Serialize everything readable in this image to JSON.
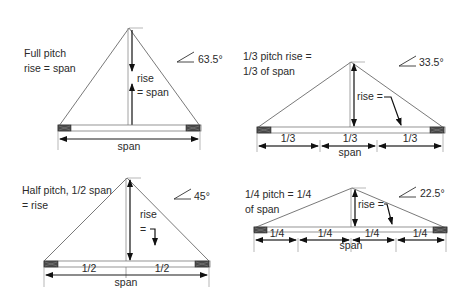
{
  "panels": [
    {
      "id": "full-pitch",
      "caption_lines": [
        "Full pitch",
        "rise = span"
      ],
      "angle": "63.5°",
      "rise_label_lines": [
        "rise",
        "= span"
      ],
      "segment_labels": [],
      "span_label": "span"
    },
    {
      "id": "third-pitch",
      "caption_lines": [
        "1/3 pitch rise =",
        "1/3 of span"
      ],
      "angle": "33.5°",
      "rise_label_lines": [
        "rise ="
      ],
      "segment_labels": [
        "1/3",
        "1/3",
        "1/3"
      ],
      "span_label": "span"
    },
    {
      "id": "half-pitch",
      "caption_lines": [
        "Half pitch, 1/2 span",
        "= rise"
      ],
      "angle": "45°",
      "rise_label_lines": [
        "rise",
        "="
      ],
      "segment_labels": [
        "1/2",
        "1/2"
      ],
      "span_label": "span"
    },
    {
      "id": "quarter-pitch",
      "caption_lines": [
        "1/4 pitch = 1/4",
        "of span"
      ],
      "angle": "22.5°",
      "rise_label_lines": [
        "rise ="
      ],
      "segment_labels": [
        "1/4",
        "1/4",
        "1/4",
        "1/4"
      ],
      "span_label": "span"
    }
  ],
  "colors": {
    "line": "#6a6a6a",
    "ink": "#1a1a1a",
    "block": "#4a4a4a"
  }
}
